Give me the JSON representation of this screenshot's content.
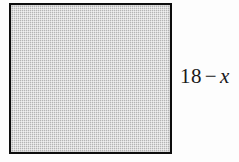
{
  "figure": {
    "type": "geometry-diagram",
    "background_color": "#fdfdfd",
    "shape": {
      "name": "square",
      "fill_color": "#c2c2c2",
      "fill_style": "stipple",
      "stroke_color": "#0d0d0d",
      "stroke_width_px": 2,
      "x_px": 9,
      "y_px": 3,
      "width_px": 163,
      "height_px": 151
    },
    "labels": [
      {
        "name": "side-length-label",
        "position": "right",
        "text": "18 − x",
        "number": "18",
        "operator": "−",
        "variable": "x",
        "variable_style": "italic",
        "color": "#191919"
      }
    ]
  }
}
